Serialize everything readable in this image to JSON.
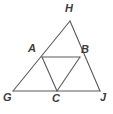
{
  "figure": {
    "kind": "geometry-diagram",
    "stroke_color": "#5a5a5a",
    "label_color": "#3c3c3c",
    "background_color": "#ffffff",
    "width": 113,
    "height": 114,
    "points": [
      {
        "name": "H",
        "label": "H",
        "x": 70,
        "y": 21,
        "label_x": 65,
        "label_y": 3
      },
      {
        "name": "A",
        "label": "A",
        "x": 42,
        "y": 57,
        "label_x": 28,
        "label_y": 43
      },
      {
        "name": "B",
        "label": "B",
        "x": 80,
        "y": 57,
        "label_x": 81,
        "label_y": 44
      },
      {
        "name": "G",
        "label": "G",
        "x": 13,
        "y": 91,
        "label_x": 3,
        "label_y": 92
      },
      {
        "name": "C",
        "label": "C",
        "x": 57,
        "y": 91,
        "label_x": 52,
        "label_y": 93
      },
      {
        "name": "J",
        "label": "J",
        "x": 100,
        "y": 91,
        "label_x": 100,
        "label_y": 92
      }
    ],
    "segments": [
      {
        "name": "side-GH",
        "from": "G",
        "to": "H",
        "path": "M 13 91 L 70 21"
      },
      {
        "name": "side-HJ",
        "from": "H",
        "to": "J",
        "path": "M 70 21 L 100 91"
      },
      {
        "name": "side-GJ",
        "from": "G",
        "to": "J",
        "path": "M 13 91 L 100 91"
      },
      {
        "name": "midsegment-AB",
        "from": "A",
        "to": "B",
        "path": "M 42 57 L 80 57"
      },
      {
        "name": "midsegment-AC",
        "from": "A",
        "to": "C",
        "path": "M 42 57 L 57 91"
      },
      {
        "name": "midsegment-BC",
        "from": "B",
        "to": "C",
        "path": "M 80 57 L 57 91"
      }
    ]
  }
}
